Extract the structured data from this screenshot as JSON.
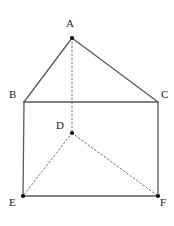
{
  "figure": {
    "background_color": "#ffffff",
    "line_color": "#5a5a5a",
    "dashed_line_color": "#6e6e6e",
    "label_color": "#1a1a1a",
    "vertex_dot_color": "#111111",
    "vertices": [
      {
        "id": "A",
        "label": "A",
        "x": 72,
        "y": 38,
        "label_x": 66,
        "label_y": 18,
        "dot": true
      },
      {
        "id": "B",
        "label": "B",
        "x": 24,
        "y": 102,
        "label_x": 9,
        "label_y": 89,
        "dot": false
      },
      {
        "id": "C",
        "label": "C",
        "x": 158,
        "y": 102,
        "label_x": 161,
        "label_y": 89,
        "dot": false
      },
      {
        "id": "D",
        "label": "D",
        "x": 72,
        "y": 133,
        "label_x": 56,
        "label_y": 120,
        "dot": true
      },
      {
        "id": "E",
        "label": "E",
        "x": 23,
        "y": 196,
        "label_x": 9,
        "label_y": 197,
        "dot": true
      },
      {
        "id": "F",
        "label": "F",
        "x": 158,
        "y": 196,
        "label_x": 160,
        "label_y": 197,
        "dot": true
      }
    ],
    "solid_edges": [
      {
        "id": "AB",
        "from": "A",
        "to": "B"
      },
      {
        "id": "AC",
        "from": "A",
        "to": "C"
      },
      {
        "id": "BC",
        "from": "B",
        "to": "C"
      },
      {
        "id": "BE",
        "from": "B",
        "to": "E"
      },
      {
        "id": "CF",
        "from": "C",
        "to": "F"
      },
      {
        "id": "EF",
        "from": "E",
        "to": "F"
      }
    ],
    "dashed_edges": [
      {
        "id": "AD",
        "from": "A",
        "to": "D"
      },
      {
        "id": "DE",
        "from": "D",
        "to": "E"
      },
      {
        "id": "DF",
        "from": "D",
        "to": "F"
      }
    ]
  }
}
